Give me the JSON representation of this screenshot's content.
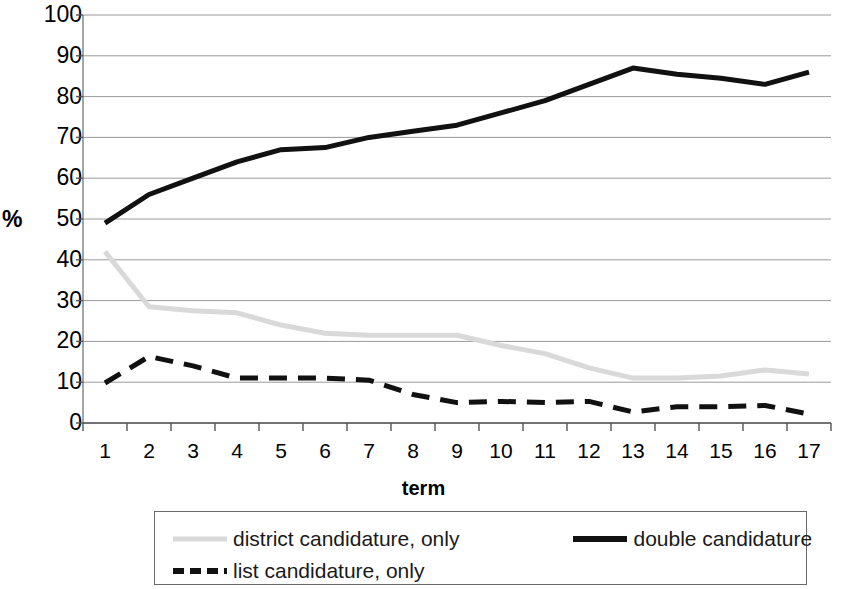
{
  "chart_data": {
    "type": "line",
    "title": "",
    "xlabel": "term",
    "ylabel": "%",
    "x": [
      1,
      2,
      3,
      4,
      5,
      6,
      7,
      8,
      9,
      10,
      11,
      12,
      13,
      14,
      15,
      16,
      17
    ],
    "xticklabels": [
      "1",
      "2",
      "3",
      "4",
      "5",
      "6",
      "7",
      "8",
      "9",
      "10",
      "11",
      "12",
      "13",
      "14",
      "15",
      "16",
      "17"
    ],
    "yticklabels": [
      "0",
      "10",
      "20",
      "30",
      "40",
      "50",
      "60",
      "70",
      "80",
      "90",
      "100"
    ],
    "yticks": [
      0,
      10,
      20,
      30,
      40,
      50,
      60,
      70,
      80,
      90,
      100
    ],
    "ylim": [
      0,
      100
    ],
    "xlim": [
      1,
      17
    ],
    "grid": "horizontal",
    "legend_position": "bottom",
    "series": [
      {
        "name": "district candidature, only",
        "style": "solid",
        "color": "#d9d9d9",
        "width": 5,
        "values": [
          42,
          28.5,
          27.5,
          27,
          24,
          22,
          21.5,
          21.5,
          21.5,
          19,
          17,
          13.5,
          11,
          11,
          11.5,
          13,
          12
        ]
      },
      {
        "name": "double candidature",
        "style": "solid",
        "color": "#111111",
        "width": 5,
        "values": [
          49,
          56,
          60,
          64,
          67,
          67.5,
          70,
          71.5,
          73,
          76,
          79,
          83,
          87,
          85.5,
          84.5,
          83,
          86
        ]
      },
      {
        "name": "list candidature, only",
        "style": "dashed",
        "color": "#111111",
        "width": 5,
        "values": [
          9.8,
          16.3,
          14,
          11,
          11,
          11,
          10.5,
          7,
          5,
          5.3,
          5,
          5.3,
          2.7,
          4,
          4,
          4.3,
          2.2
        ]
      }
    ]
  },
  "legend": {
    "items": [
      {
        "label": "district candidature, only",
        "style": "solid-light"
      },
      {
        "label": "double candidature",
        "style": "solid-dark"
      },
      {
        "label": "list candidature, only",
        "style": "dashed-dark"
      }
    ]
  }
}
